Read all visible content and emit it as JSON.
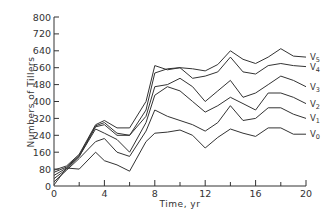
{
  "chart_data": {
    "type": "line",
    "title": "",
    "xlabel": "Time,  yr",
    "ylabel": "Numbers of Tillers",
    "xlim": [
      0,
      20
    ],
    "ylim": [
      0,
      800
    ],
    "x_ticks": [
      0,
      4,
      8,
      12,
      16,
      20
    ],
    "x_minor_ticks": [
      2,
      6,
      10,
      14,
      18
    ],
    "y_ticks": [
      0,
      80,
      160,
      240,
      320,
      400,
      480,
      560,
      640,
      720,
      800
    ],
    "grid": false,
    "legend": "inline labels at right end of each line",
    "x": [
      0,
      1,
      2,
      3.3,
      4,
      5,
      6,
      7.3,
      8,
      9,
      10,
      11,
      12,
      13,
      14,
      15,
      16,
      17,
      18,
      19,
      20
    ],
    "series": [
      {
        "name": "V5",
        "label_main": "V",
        "label_sub": "5",
        "values": [
          75,
          95,
          150,
          290,
          310,
          275,
          275,
          400,
          570,
          550,
          560,
          555,
          545,
          575,
          640,
          600,
          580,
          610,
          650,
          615,
          610
        ]
      },
      {
        "name": "V4",
        "label_main": "V",
        "label_sub": "4",
        "values": [
          65,
          90,
          145,
          285,
          300,
          250,
          240,
          360,
          535,
          555,
          560,
          510,
          520,
          540,
          610,
          540,
          530,
          570,
          580,
          570,
          565
        ]
      },
      {
        "name": "V3",
        "label_main": "V",
        "label_sub": "3",
        "values": [
          50,
          85,
          140,
          280,
          290,
          240,
          240,
          330,
          470,
          480,
          510,
          470,
          400,
          450,
          500,
          420,
          440,
          480,
          520,
          500,
          470
        ]
      },
      {
        "name": "V2",
        "label_main": "V",
        "label_sub": "2",
        "values": [
          35,
          80,
          140,
          270,
          250,
          220,
          160,
          300,
          430,
          470,
          450,
          400,
          350,
          380,
          420,
          390,
          360,
          440,
          440,
          420,
          390
        ]
      },
      {
        "name": "V1",
        "label_main": "V",
        "label_sub": "1",
        "values": [
          20,
          75,
          130,
          210,
          225,
          160,
          140,
          260,
          360,
          330,
          310,
          290,
          260,
          300,
          380,
          310,
          320,
          370,
          370,
          340,
          320
        ]
      },
      {
        "name": "V0",
        "label_main": "V",
        "label_sub": "0",
        "values": [
          5,
          85,
          80,
          160,
          120,
          100,
          70,
          210,
          250,
          255,
          265,
          240,
          180,
          230,
          270,
          250,
          235,
          275,
          275,
          245,
          245
        ]
      }
    ]
  },
  "axes": {
    "x_title": "Time,  yr",
    "y_title": "Numbers of Tillers"
  }
}
